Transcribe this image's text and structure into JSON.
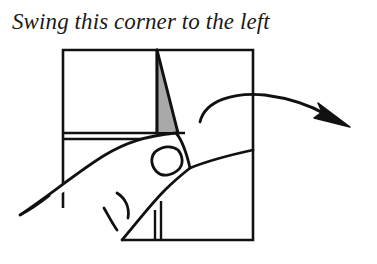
{
  "caption": "Swing this corner to the left",
  "diagram": {
    "elements": [
      "paper-square",
      "crease-line",
      "folded-flap",
      "shaded-back-side",
      "hand",
      "curved-arrow"
    ],
    "colors": {
      "line": "#111111",
      "shade": "#a9a9a9",
      "paper": "#ffffff"
    }
  }
}
